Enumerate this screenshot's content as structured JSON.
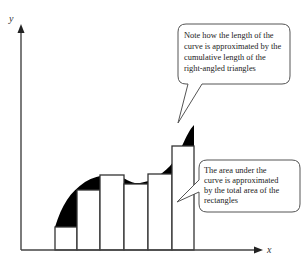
{
  "axes": {
    "x_label": "x",
    "y_label": "y"
  },
  "callouts": {
    "top": {
      "lines": [
        "Note how the length of the",
        "curve is approximated by the",
        "cumulative length of the",
        "right-angled triangles"
      ]
    },
    "bottom": {
      "lines": [
        "The area under the",
        "curve is approximated",
        "by the total area of the",
        "rectangles"
      ]
    }
  },
  "rectangles": {
    "count": 6,
    "description": "rectangles under curve with black right-angled triangle gaps"
  },
  "colors": {
    "stroke": "#333333",
    "fill_dark": "#000000",
    "background": "#ffffff"
  }
}
